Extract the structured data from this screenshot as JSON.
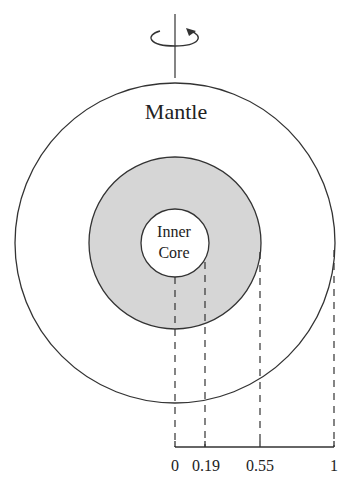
{
  "diagram": {
    "title": "",
    "layers": [
      {
        "name": "Mantle",
        "label": "Mantle",
        "fill": "#ffffff",
        "outer_radius_fraction": 1
      },
      {
        "name": "Outer Core (shaded)",
        "label": "",
        "fill": "#d9d9d9",
        "outer_radius_fraction": 0.55
      },
      {
        "name": "Inner Core",
        "label_line1": "Inner",
        "label_line2": "Core",
        "fill": "#ffffff",
        "outer_radius_fraction": 0.19
      }
    ],
    "mantle_label": "Mantle",
    "core_label_line1": "Inner",
    "core_label_line2": "Core",
    "rotation_symbol": "rotation-arrow-about-vertical-axis",
    "radius_axis": {
      "ticks": [
        "0",
        "0.19",
        "0.55",
        "1"
      ],
      "tick0": "0",
      "tick1": "0.19",
      "tick2": "0.55",
      "tick3": "1"
    },
    "colors": {
      "line": "#333333",
      "shade": "#d6d6d6",
      "background": "#ffffff"
    }
  }
}
